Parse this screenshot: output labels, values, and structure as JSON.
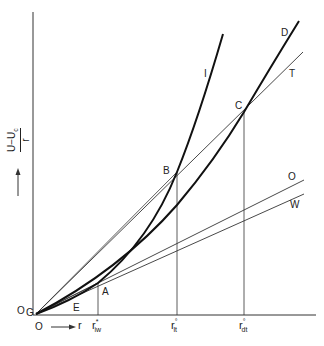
{
  "diagram": {
    "y_axis_label": {
      "numerator": "U−U",
      "numerator_sub": "c",
      "denominator": "r"
    },
    "x_axis_label": "r",
    "origin_labels": {
      "x_origin": "O",
      "y_origin": "O",
      "point": "G"
    },
    "points": {
      "A": "A",
      "B": "B",
      "C": "C",
      "E": "E"
    },
    "curves": {
      "I": "I",
      "D": "D"
    },
    "lines": {
      "T": "T",
      "O": "O",
      "W": "W"
    },
    "x_ticks": [
      {
        "base": "r",
        "sub": "iw",
        "sup": "*"
      },
      {
        "base": "r",
        "sub": "lt",
        "sup": "°"
      },
      {
        "base": "r",
        "sub": "dt",
        "sup": "°"
      }
    ],
    "colors": {
      "ink": "#222222",
      "background": "#ffffff"
    }
  }
}
